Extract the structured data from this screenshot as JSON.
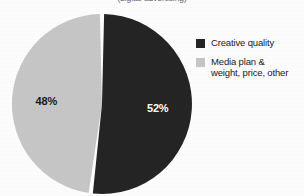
{
  "title": "(digital advertising)",
  "colors": {
    "background": "#ffffff",
    "dark_slice": "#252525",
    "light_slice": "#c8c8c8",
    "separator": "#ffffff",
    "dark_label_text": "#ffffff",
    "light_label_text": "#1a1a1a",
    "legend_text": "#1a1a1a"
  },
  "legend": {
    "items": [
      {
        "label": "Creative quality",
        "line1": "Creative quality",
        "line2": "",
        "swatch_color": "#252525",
        "swatch_name": "legend-swatch-creative-quality"
      },
      {
        "label": "Media plan & weight, price, other",
        "line1": "Media plan &",
        "line2": "weight, price, other",
        "swatch_color": "#c8c8c8",
        "swatch_name": "legend-swatch-media-plan"
      }
    ]
  },
  "labels": {
    "dark_slice_value": "52%",
    "light_slice_value": "48%"
  },
  "chart_data": {
    "type": "pie",
    "title": "(digital advertising)",
    "xlabel": "",
    "ylabel": "",
    "legend_position": "right",
    "grid": false,
    "start_angle_deg": 0,
    "direction": "clockwise",
    "categories": [
      "Creative quality",
      "Media plan & weight, price, other"
    ],
    "values": [
      52,
      48
    ],
    "value_labels": [
      "52%",
      "48%"
    ],
    "units": "percent",
    "total": 100,
    "slice_colors": [
      "#252525",
      "#c8c8c8"
    ],
    "series": [
      {
        "name": "Share of advertising effectiveness",
        "values": [
          52,
          48
        ]
      }
    ]
  }
}
